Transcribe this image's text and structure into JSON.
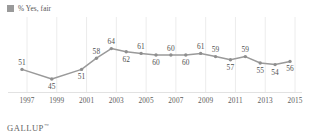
{
  "legend": {
    "swatch_icon": "legend-swatch-square",
    "label": "% Yes, fair",
    "color": "#9a9a9a"
  },
  "footer": {
    "brand": "GALLUP",
    "trademark": "™"
  },
  "style": {
    "line_color": "#9a9a9a",
    "marker_color": "#8f8f8f",
    "gridline_color": "#ececec",
    "axis_color": "#e2e2e2",
    "label_color": "#4f4f4f",
    "background": "#ffffff"
  },
  "chart_data": {
    "type": "line",
    "title": "",
    "subtitle": "",
    "xlabel": "",
    "ylabel": "",
    "grid": "vertical",
    "legend_position": "top-left",
    "ylim": [
      40,
      70
    ],
    "xlim": [
      1997,
      2015
    ],
    "tick_labels": [
      "1997",
      "1999",
      "2001",
      "2003",
      "2005",
      "2007",
      "2009",
      "2011",
      "2013",
      "2015"
    ],
    "x": [
      1997,
      1998,
      1999,
      2000,
      2001,
      2002,
      2003,
      2004,
      2005,
      2006,
      2007,
      2008,
      2009,
      2010,
      2011,
      2012,
      2013,
      2014,
      2015
    ],
    "series": [
      {
        "name": "% Yes, fair",
        "values": [
          51,
          null,
          45,
          null,
          51,
          58,
          64,
          62,
          61,
          60,
          60,
          60,
          61,
          59,
          57,
          59,
          55,
          54,
          56
        ]
      }
    ],
    "points": [
      {
        "x": 1997,
        "value": 51,
        "label": "51",
        "label_pos": "above"
      },
      {
        "x": 1999,
        "value": 45,
        "label": "45",
        "label_pos": "below"
      },
      {
        "x": 2001,
        "value": 51,
        "label": "51",
        "label_pos": "below"
      },
      {
        "x": 2002,
        "value": 58,
        "label": "58",
        "label_pos": "above"
      },
      {
        "x": 2003,
        "value": 64,
        "label": "64",
        "label_pos": "above"
      },
      {
        "x": 2004,
        "value": 62,
        "label": "62",
        "label_pos": "below"
      },
      {
        "x": 2005,
        "value": 61,
        "label": "61",
        "label_pos": "above"
      },
      {
        "x": 2006,
        "value": 60,
        "label": "60",
        "label_pos": "below"
      },
      {
        "x": 2007,
        "value": 60,
        "label": "60",
        "label_pos": "above"
      },
      {
        "x": 2008,
        "value": 60,
        "label": "60",
        "label_pos": "below"
      },
      {
        "x": 2009,
        "value": 61,
        "label": "61",
        "label_pos": "above"
      },
      {
        "x": 2010,
        "value": 59,
        "label": "59",
        "label_pos": "above"
      },
      {
        "x": 2011,
        "value": 57,
        "label": "57",
        "label_pos": "below"
      },
      {
        "x": 2012,
        "value": 59,
        "label": "59",
        "label_pos": "above"
      },
      {
        "x": 2013,
        "value": 55,
        "label": "55",
        "label_pos": "below"
      },
      {
        "x": 2014,
        "value": 54,
        "label": "54",
        "label_pos": "below"
      },
      {
        "x": 2015,
        "value": 56,
        "label": "56",
        "label_pos": "below"
      }
    ]
  }
}
